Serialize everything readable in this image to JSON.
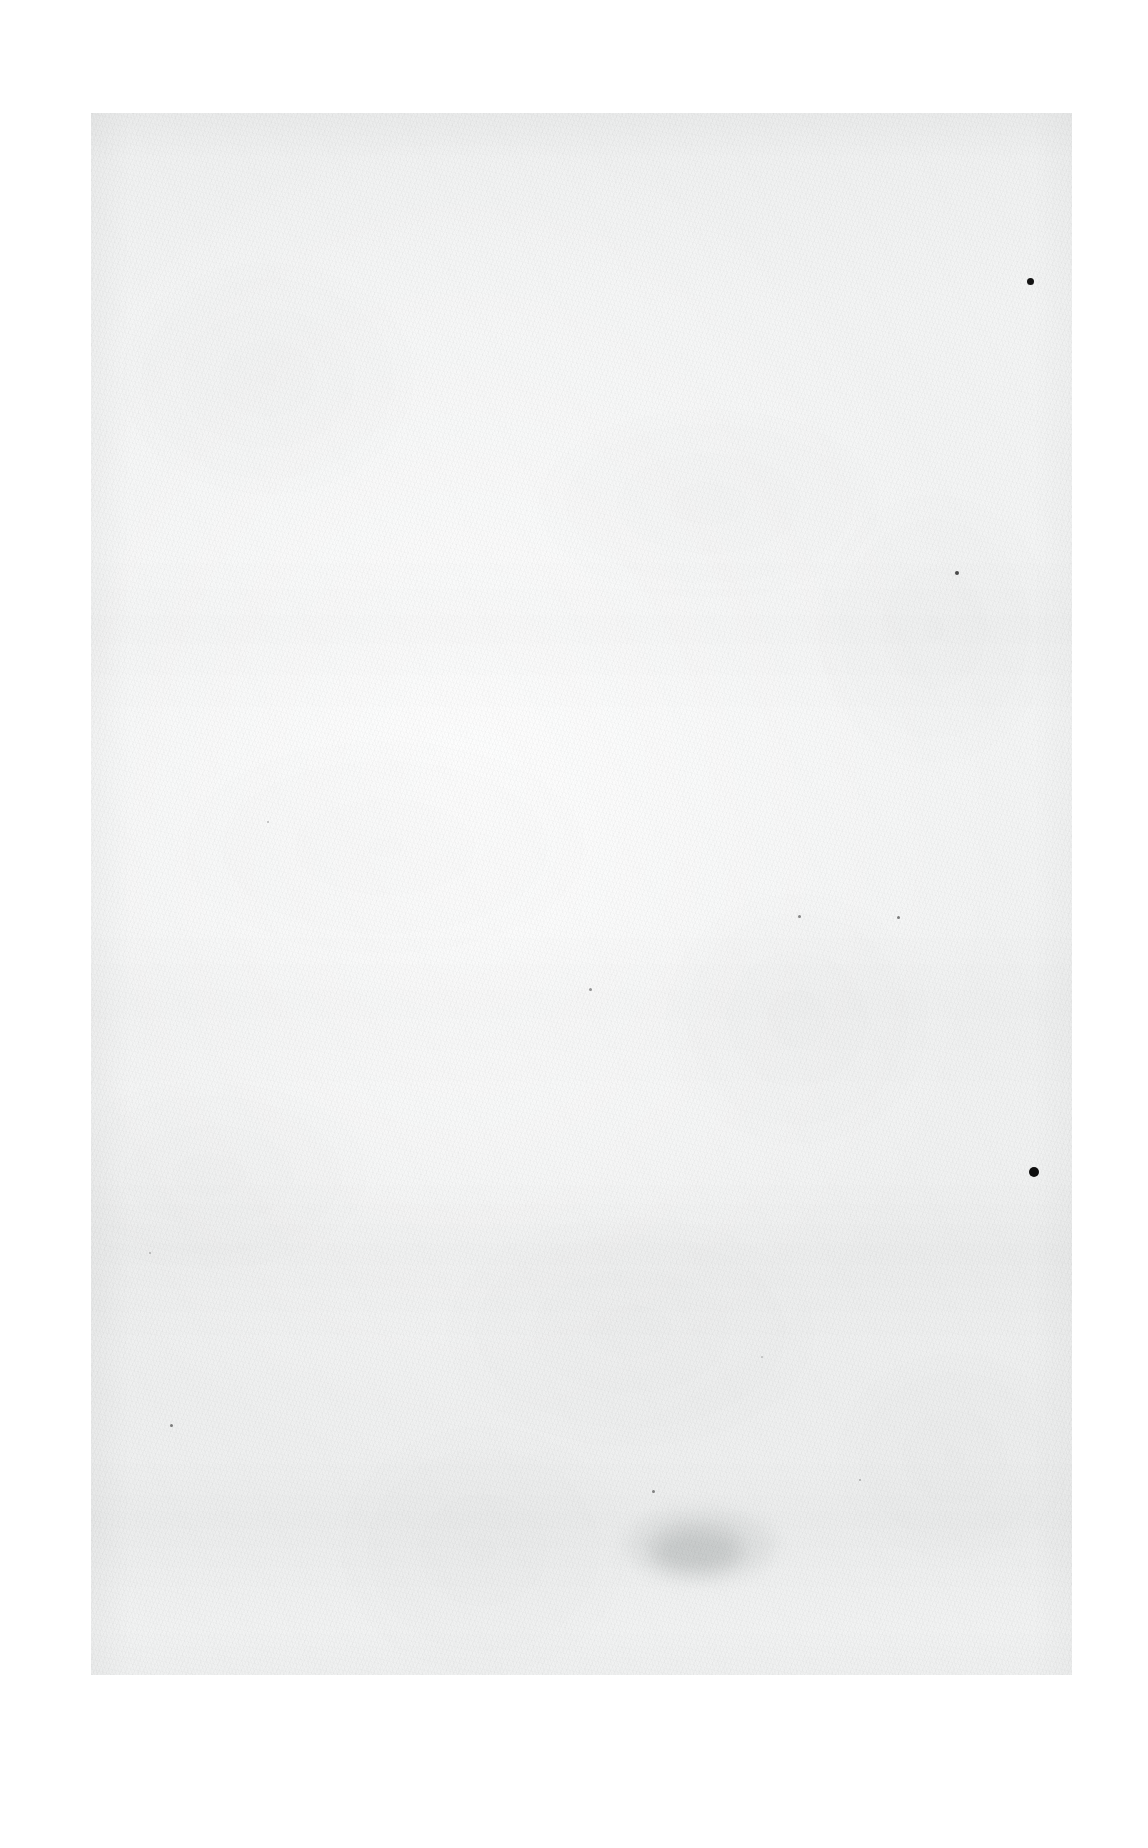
{
  "document": {
    "kind": "scanned-page",
    "page_content": "",
    "text_content_present": false,
    "description": "Blank scanned sheet of paper with no printed or handwritten text",
    "page_number_label": ""
  },
  "canvas": {
    "width": 1148,
    "height": 1848,
    "background_color": "#ffffff"
  },
  "sheet": {
    "left": 91,
    "top": 113,
    "width": 981,
    "height": 1562,
    "paper_color": "#f2f3f3",
    "highlight_color": "#f6f7f7",
    "shadow_color": "#eceded"
  },
  "artifacts": {
    "ink_dots": [
      {
        "name": "ink-dot-upper-right",
        "x": 1030,
        "y": 281,
        "size": 7,
        "color": "#141414",
        "opacity": 1.0
      },
      {
        "name": "ink-dot-lower-right",
        "x": 1034,
        "y": 1172,
        "size": 10,
        "color": "#0e0e0e",
        "opacity": 1.0
      }
    ],
    "specks": [
      {
        "name": "speck-right-mid",
        "x": 957,
        "y": 573,
        "size": 4,
        "color": "#2e2e2e",
        "opacity": 0.85
      },
      {
        "name": "speck-centre-right-a",
        "x": 799,
        "y": 916,
        "size": 3,
        "color": "#555555",
        "opacity": 0.7
      },
      {
        "name": "speck-centre-right-b",
        "x": 898,
        "y": 917,
        "size": 3,
        "color": "#4d4d4d",
        "opacity": 0.72
      },
      {
        "name": "speck-centre",
        "x": 590,
        "y": 989,
        "size": 3,
        "color": "#5a5a5a",
        "opacity": 0.62
      },
      {
        "name": "speck-left-lower",
        "x": 171,
        "y": 1425,
        "size": 3,
        "color": "#4a4a4a",
        "opacity": 0.7
      },
      {
        "name": "speck-centre-lower",
        "x": 653,
        "y": 1491,
        "size": 3,
        "color": "#4f4f4f",
        "opacity": 0.68
      },
      {
        "name": "speck-right-lower",
        "x": 860,
        "y": 1480,
        "size": 2,
        "color": "#6a6a6a",
        "opacity": 0.5
      },
      {
        "name": "speck-upper-left",
        "x": 268,
        "y": 822,
        "size": 2,
        "color": "#707070",
        "opacity": 0.45
      },
      {
        "name": "speck-mid-left",
        "x": 150,
        "y": 1253,
        "size": 2,
        "color": "#6d6d6d",
        "opacity": 0.48
      },
      {
        "name": "speck-lower-centre",
        "x": 762,
        "y": 1357,
        "size": 2,
        "color": "#737373",
        "opacity": 0.42
      }
    ],
    "smudges": [
      {
        "name": "smudge-lower-centre",
        "x": 697,
        "y": 1550,
        "width": 90,
        "height": 44,
        "color": "#b9bcbc",
        "opacity": 0.38
      },
      {
        "name": "smudge-lower-centre-soft",
        "x": 700,
        "y": 1545,
        "width": 150,
        "height": 70,
        "color": "#cfd2d2",
        "opacity": 0.3
      }
    ]
  }
}
